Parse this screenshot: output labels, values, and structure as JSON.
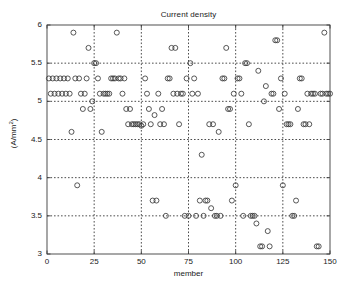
{
  "chart_data": {
    "type": "scatter",
    "title": "Current density",
    "xlabel": "member",
    "ylabel": "(A/mm2)",
    "ylabel_display": "(A/mm²)",
    "xlim": [
      0,
      150
    ],
    "ylim": [
      3,
      6
    ],
    "xticks": [
      0,
      25,
      50,
      75,
      100,
      125,
      150
    ],
    "yticks": [
      3,
      3.5,
      4,
      4.5,
      5,
      5.5,
      6
    ],
    "xtick_labels": [
      "0",
      "25",
      "50",
      "75",
      "100",
      "125",
      "150"
    ],
    "ytick_labels": [
      "3",
      "3.5",
      "4",
      "4.5",
      "5",
      "5.5",
      "6"
    ],
    "grid": true,
    "grid_style": "dotted",
    "legend": null,
    "marker": "open-circle",
    "marker_color": "#3a3a3a",
    "background": "#ffffff",
    "x": [
      1,
      2,
      3,
      4,
      5,
      6,
      7,
      8,
      9,
      10,
      11,
      12,
      13,
      14,
      15,
      16,
      17,
      18,
      19,
      20,
      21,
      22,
      23,
      24,
      25,
      26,
      27,
      28,
      29,
      30,
      31,
      32,
      33,
      34,
      35,
      36,
      37,
      38,
      39,
      40,
      41,
      42,
      43,
      44,
      45,
      46,
      47,
      48,
      49,
      50,
      51,
      52,
      53,
      54,
      55,
      56,
      57,
      58,
      59,
      60,
      61,
      62,
      63,
      64,
      65,
      66,
      67,
      68,
      69,
      70,
      71,
      72,
      73,
      74,
      75,
      76,
      77,
      78,
      79,
      80,
      81,
      82,
      83,
      84,
      85,
      86,
      87,
      88,
      89,
      90,
      91,
      92,
      93,
      94,
      95,
      96,
      97,
      98,
      99,
      100,
      101,
      102,
      103,
      104,
      105,
      106,
      107,
      108,
      109,
      110,
      111,
      112,
      113,
      114,
      115,
      116,
      117,
      118,
      119,
      120,
      121,
      122,
      123,
      124,
      125,
      126,
      127,
      128,
      129,
      130,
      131,
      132,
      133,
      134,
      135,
      136,
      137,
      138,
      139,
      140,
      141,
      142,
      143,
      144,
      145,
      146,
      147,
      148,
      149,
      150
    ],
    "y": [
      5.3,
      5.1,
      5.3,
      5.1,
      5.3,
      5.1,
      5.3,
      5.1,
      5.3,
      5.1,
      5.3,
      5.1,
      4.6,
      5.9,
      5.3,
      3.9,
      5.3,
      5.1,
      4.9,
      5.1,
      5.3,
      5.7,
      4.9,
      5.0,
      5.5,
      5.5,
      5.3,
      5.1,
      4.6,
      5.1,
      5.1,
      5.1,
      5.1,
      5.3,
      5.3,
      5.3,
      5.9,
      5.3,
      5.3,
      5.1,
      5.3,
      4.9,
      4.7,
      4.9,
      4.7,
      4.7,
      4.7,
      4.7,
      4.7,
      4.68,
      4.7,
      5.3,
      5.1,
      4.9,
      4.7,
      3.7,
      4.82,
      3.7,
      5.1,
      4.7,
      4.9,
      4.7,
      3.5,
      5.3,
      5.3,
      5.7,
      5.1,
      5.7,
      5.1,
      4.7,
      5.1,
      5.1,
      3.5,
      5.3,
      3.5,
      5.5,
      5.1,
      5.3,
      3.5,
      5.1,
      3.7,
      4.3,
      3.5,
      3.7,
      3.7,
      4.7,
      3.6,
      4.7,
      3.5,
      3.5,
      4.6,
      3.5,
      5.3,
      5.3,
      5.7,
      4.9,
      4.9,
      3.7,
      5.1,
      3.9,
      5.3,
      5.3,
      5.1,
      3.5,
      5.5,
      5.5,
      4.7,
      3.5,
      3.5,
      3.5,
      3.4,
      5.4,
      3.1,
      3.1,
      5.0,
      5.2,
      3.3,
      3.1,
      5.1,
      5.1,
      5.8,
      5.8,
      4.9,
      5.3,
      3.9,
      5.1,
      4.7,
      4.7,
      4.7,
      3.5,
      3.5,
      3.7,
      4.9,
      5.3,
      5.3,
      4.7,
      4.7,
      5.1,
      4.7,
      5.1,
      5.1,
      5.1,
      3.1,
      3.1,
      5.1,
      5.1,
      5.9,
      5.1,
      5.1,
      5.1
    ]
  },
  "plot_geometry": {
    "left": 47,
    "top": 25,
    "width": 283,
    "height": 229
  }
}
